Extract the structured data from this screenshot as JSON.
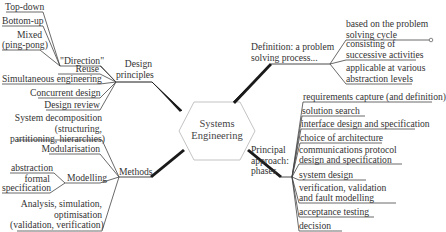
{
  "center": {
    "line1": "Systems",
    "line2": "Engineering"
  },
  "design_principles": {
    "title_line1": "Design",
    "title_line2": "principles",
    "direction": {
      "label": "\"Direction\"",
      "items": [
        "Top-down",
        "Bottom-up",
        "Mixed",
        "(ping-pong)"
      ]
    },
    "items": [
      "Reuse",
      "Simultaneous engineering",
      "Concurrent design",
      "Design review"
    ]
  },
  "methods": {
    "title": "Methods",
    "decomposition": {
      "line1": "System decomposition",
      "line2": "(structuring,",
      "line3": "partitioning, hierarchies)"
    },
    "modularisation": "Modularisation",
    "modelling": {
      "label": "Modelling",
      "items": [
        "abstraction",
        "formal",
        "specification"
      ]
    },
    "analysis": {
      "line1": "Analysis, simulation,",
      "line2": "optimisation",
      "line3": "(validation, verification)"
    }
  },
  "definition": {
    "line1": "Definition: a problem",
    "line2": "solving process...",
    "items": [
      {
        "line1": "based on the problem",
        "line2": "solving cycle"
      },
      {
        "line1": "consisting of",
        "line2": "successive activities"
      },
      {
        "line1": "applicable at various",
        "line2": "abstraction levels"
      }
    ]
  },
  "approach": {
    "line1": "Principal",
    "line2": "approach:",
    "line3": "phases",
    "phases": [
      "requirements capture (and definition)",
      "solution search",
      "interface design and specification",
      "choice of architecture",
      "communications protocol",
      "design and specification",
      "system design",
      "verification, validation",
      "and fault modelling",
      "acceptance testing",
      "decision"
    ]
  },
  "colors": {
    "line": "#333333",
    "thick_branch": "#1a1a1a",
    "hexagon_stroke": "#bbbbbb",
    "text": "#333333"
  }
}
